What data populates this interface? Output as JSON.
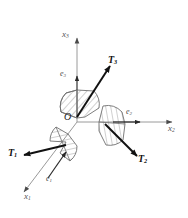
{
  "figure": {
    "background_color": "#ffffff",
    "axis_color": "#8c8c8c",
    "vector_color": "#1a1a1a",
    "wedge_fill": "#ffffff",
    "wedge_stroke": "#707070",
    "hatch_color": "#808080"
  },
  "origin": {
    "label": "O"
  },
  "axes": [
    {
      "name": "x1",
      "label": "x",
      "sub": "1",
      "direction": "lower-left-diagonal"
    },
    {
      "name": "x2",
      "label": "x",
      "sub": "2",
      "direction": "right-horizontal"
    },
    {
      "name": "x3",
      "label": "x",
      "sub": "3",
      "direction": "up-vertical"
    }
  ],
  "basis_vectors": [
    {
      "name": "e1",
      "label": "e",
      "sub": "1",
      "along_axis": "x1"
    },
    {
      "name": "e2",
      "label": "e",
      "sub": "2",
      "along_axis": "x2"
    },
    {
      "name": "e3",
      "label": "e",
      "sub": "3",
      "along_axis": "x3"
    }
  ],
  "traction_vectors": [
    {
      "name": "T1",
      "label": "T",
      "sub": "1",
      "direction": "left-slightly-down",
      "on_plane": "x1"
    },
    {
      "name": "T2",
      "label": "T",
      "sub": "2",
      "direction": "down-right",
      "on_plane": "x2"
    },
    {
      "name": "T3",
      "label": "T",
      "sub": "3",
      "direction": "up-right",
      "on_plane": "x3"
    }
  ],
  "wedges": [
    {
      "name": "wedge-x3",
      "position": "above-origin",
      "hatched": true
    },
    {
      "name": "wedge-x2",
      "position": "right-of-origin",
      "hatched": true
    },
    {
      "name": "wedge-x1",
      "position": "lower-left-of-origin",
      "hatched": true
    }
  ]
}
